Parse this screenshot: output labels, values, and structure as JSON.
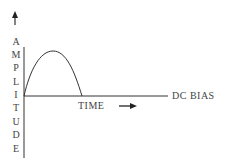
{
  "diagram": {
    "y_axis_label_letters": [
      "A",
      "M",
      "P",
      "L",
      "I",
      "T",
      "U",
      "D",
      "E"
    ],
    "y_axis_label": "AMPLITUDE",
    "baseline_label": "DC BIAS",
    "time_label": "TIME",
    "time_arrow": "→",
    "colors": {
      "line": "#333333",
      "text": "#444444"
    }
  }
}
